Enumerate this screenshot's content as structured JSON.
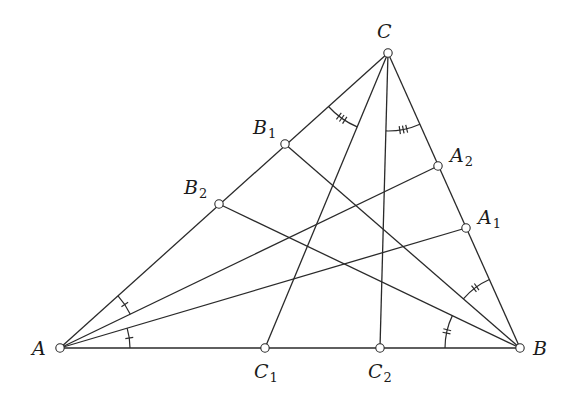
{
  "diagram": {
    "type": "geometry-triangle-cevians",
    "points": {
      "A": {
        "x": 60,
        "y": 348,
        "label": "A",
        "sub": "",
        "lx": 32,
        "ly": 355
      },
      "B": {
        "x": 520,
        "y": 348,
        "label": "B",
        "sub": "",
        "lx": 533,
        "ly": 355
      },
      "C": {
        "x": 388,
        "y": 53,
        "label": "C",
        "sub": "",
        "lx": 377,
        "ly": 38
      },
      "A1": {
        "x": 466,
        "y": 228,
        "label": "A",
        "sub": "1",
        "lx": 478,
        "ly": 224
      },
      "A2": {
        "x": 438,
        "y": 166,
        "label": "A",
        "sub": "2",
        "lx": 450,
        "ly": 162
      },
      "B1": {
        "x": 285,
        "y": 144,
        "label": "B",
        "sub": "1",
        "lx": 253,
        "ly": 134
      },
      "B2": {
        "x": 219,
        "y": 204,
        "label": "B",
        "sub": "2",
        "lx": 184,
        "ly": 194
      },
      "C1": {
        "x": 265,
        "y": 348,
        "label": "C",
        "sub": "1",
        "lx": 254,
        "ly": 378
      },
      "C2": {
        "x": 380,
        "y": 348,
        "label": "C",
        "sub": "2",
        "lx": 368,
        "ly": 378
      }
    },
    "segments": [
      [
        "A",
        "B"
      ],
      [
        "B",
        "C"
      ],
      [
        "C",
        "A"
      ],
      [
        "A",
        "A1"
      ],
      [
        "A",
        "A2"
      ],
      [
        "B",
        "B1"
      ],
      [
        "B",
        "B2"
      ],
      [
        "C",
        "C1"
      ],
      [
        "C",
        "C2"
      ]
    ],
    "angle_marks": [
      {
        "vertex": "A",
        "from": "B",
        "to": "A1",
        "radius": 70,
        "ticks": 1
      },
      {
        "vertex": "A",
        "from": "A2",
        "to": "C",
        "radius": 78,
        "ticks": 1
      },
      {
        "vertex": "B",
        "from": "A",
        "to": "B2",
        "radius": 75,
        "ticks": 2
      },
      {
        "vertex": "B",
        "from": "B1",
        "to": "C",
        "radius": 75,
        "ticks": 2
      },
      {
        "vertex": "C",
        "from": "A",
        "to": "C1",
        "radius": 80,
        "ticks": 3
      },
      {
        "vertex": "C",
        "from": "C2",
        "to": "B",
        "radius": 78,
        "ticks": 3
      }
    ],
    "labels": {
      "A": "A",
      "B": "B",
      "C": "C",
      "A1": "A",
      "A1_sub": "1",
      "A2": "A",
      "A2_sub": "2",
      "B1": "B",
      "B1_sub": "1",
      "B2": "B",
      "B2_sub": "2",
      "C1": "C",
      "C1_sub": "1",
      "C2": "C",
      "C2_sub": "2"
    }
  }
}
